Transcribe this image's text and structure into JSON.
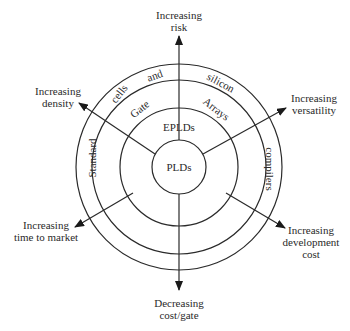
{
  "diagram": {
    "rings": {
      "inner": "PLDs",
      "second": "EPLDs",
      "third_left": "Gate",
      "third_right": "Arrays",
      "outer_words": [
        "Standard",
        "cells",
        "and",
        "silicon",
        "compilers"
      ]
    },
    "arrows": [
      {
        "id": "risk",
        "lines": [
          "Increasing",
          "risk"
        ]
      },
      {
        "id": "versatility",
        "lines": [
          "Increasing",
          "versatility"
        ]
      },
      {
        "id": "development-cost",
        "lines": [
          "Increasing",
          "development",
          "cost"
        ]
      },
      {
        "id": "cost-gate",
        "lines": [
          "Decreasing",
          "cost/gate"
        ]
      },
      {
        "id": "time-to-market",
        "lines": [
          "Increasing",
          "time to market"
        ]
      },
      {
        "id": "density",
        "lines": [
          "Increasing",
          "density"
        ]
      }
    ]
  }
}
